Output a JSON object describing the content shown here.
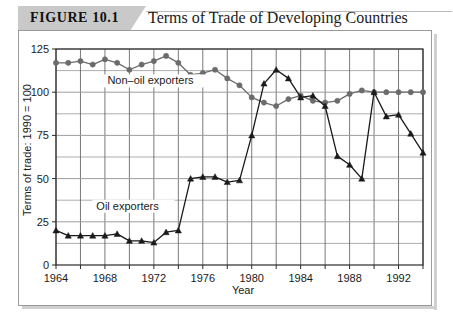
{
  "figure": {
    "badge_label": "FIGURE 10.1",
    "title": "Terms of Trade of Developing Countries"
  },
  "chart_data": {
    "type": "line",
    "title": "Terms of Trade of Developing Countries",
    "xlabel": "Year",
    "ylabel": "Terms of trade: 1990 = 100",
    "xlim": [
      1964,
      1994
    ],
    "ylim": [
      0,
      125
    ],
    "ytick_labels": [
      "0",
      "25",
      "50",
      "75",
      "100",
      "125"
    ],
    "yticks": [
      0,
      25,
      50,
      75,
      100,
      125
    ],
    "y_minor_step": 12.5,
    "xtick_labels": [
      "1964",
      "1968",
      "1972",
      "1976",
      "1980",
      "1984",
      "1988",
      "1992"
    ],
    "xticks": [
      1964,
      1968,
      1972,
      1976,
      1980,
      1984,
      1988,
      1992
    ],
    "x_minor_step": 2,
    "grid": true,
    "legend": "inline-annotations",
    "x": [
      1964,
      1965,
      1966,
      1967,
      1968,
      1969,
      1970,
      1971,
      1972,
      1973,
      1974,
      1975,
      1976,
      1977,
      1978,
      1979,
      1980,
      1981,
      1982,
      1983,
      1984,
      1985,
      1986,
      1987,
      1988,
      1989,
      1990,
      1991,
      1992,
      1993,
      1994
    ],
    "series": [
      {
        "name": "Non-oil exporters",
        "label": "Non–oil exporters",
        "color": "#6b6b6b",
        "marker": "circle",
        "values": [
          117,
          117,
          118,
          116,
          119,
          117,
          113,
          116,
          118,
          121,
          117,
          110,
          111,
          113,
          108,
          104,
          97,
          94,
          92,
          96,
          98,
          95,
          94,
          95,
          99,
          101,
          100,
          100,
          100,
          100,
          100
        ]
      },
      {
        "name": "Oil exporters",
        "label": "Oil exporters",
        "color": "#1a1a1a",
        "marker": "triangle",
        "values": [
          20,
          17,
          17,
          17,
          17,
          18,
          14,
          14,
          13,
          19,
          20,
          50,
          51,
          51,
          48,
          49,
          75,
          105,
          113,
          108,
          97,
          98,
          92,
          63,
          58,
          50,
          100,
          86,
          87,
          76,
          65
        ]
      }
    ],
    "annotations": [
      {
        "text": "Non–oil exporters",
        "x": 1968.2,
        "y": 104.5
      },
      {
        "text": "Oil exporters",
        "x": 1967.3,
        "y": 32.0
      }
    ]
  }
}
